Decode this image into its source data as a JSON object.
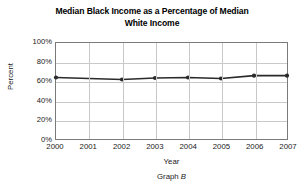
{
  "chart_data": {
    "type": "line",
    "title": "Median Black Income as a Percentage of Median White Income",
    "title_line1": "Median Black Income as a Percentage of Median",
    "title_line2": "White Income",
    "xlabel": "Year",
    "ylabel": "Percent",
    "categories": [
      "2000",
      "2001",
      "2002",
      "2003",
      "2004",
      "2005",
      "2006",
      "2007"
    ],
    "x": [
      2000,
      2001,
      2002,
      2003,
      2004,
      2005,
      2006,
      2007
    ],
    "values": [
      64,
      63,
      62,
      63.5,
      64,
      63,
      66,
      66
    ],
    "point_markers": [
      true,
      false,
      true,
      true,
      true,
      true,
      true,
      true
    ],
    "ylim": [
      0,
      100
    ],
    "xlim": [
      2000,
      2007
    ],
    "y_ticks": [
      "0%",
      "20%",
      "40%",
      "60%",
      "80%",
      "100%"
    ],
    "y_tick_values": [
      0,
      20,
      40,
      60,
      80,
      100
    ],
    "x_ticks": [
      "2000",
      "2001",
      "2002",
      "2003",
      "2004",
      "2005",
      "2006",
      "2007"
    ],
    "grid": true,
    "grid_color": "#c9c9c9",
    "legend": false,
    "series_color": "#2a2a2a",
    "frame_color": "#7a7a7a",
    "background": "#ffffff"
  },
  "caption": {
    "prefix": "Graph ",
    "id": "B",
    "full": "Graph B"
  }
}
